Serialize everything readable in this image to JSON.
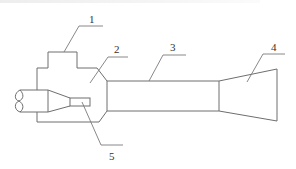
{
  "diagram": {
    "type": "schematic cross-section (ejector / jet pump)",
    "stroke_color": "#6e6e6e",
    "label_color": "#333333",
    "callouts": [
      {
        "id": "1",
        "label": "1",
        "part": "stepped housing"
      },
      {
        "id": "2",
        "label": "2",
        "part": "suction chamber"
      },
      {
        "id": "3",
        "label": "3",
        "part": "mixing tube"
      },
      {
        "id": "4",
        "label": "4",
        "part": "diffuser"
      },
      {
        "id": "5",
        "label": "5",
        "part": "nozzle"
      }
    ]
  }
}
